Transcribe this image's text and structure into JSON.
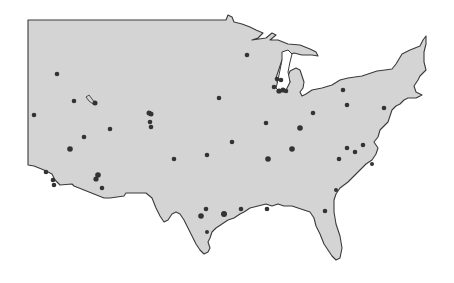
{
  "map": {
    "title": "",
    "region": "Contiguous United States (central & eastern)",
    "colors": {
      "land": "#d4d4d4",
      "water": "#ffffff",
      "coastline": "#3a3a3a",
      "marker": "#333333"
    },
    "land_outline": "M28,20 L226,20 L228,15 L232,17 L234,22 L242,24 L250,27 L256,30 L263,33 L258,38 L252,40 L266,38 L272,33 L276,35 L270,40 L278,40 L288,44 L300,45 L310,49 L316,52 L318,56 L312,55 L302,55 L294,53 L288,55 L285,58 L282,60 L280,66 L278,72 L276,78 L278,84 L281,88 L287,88 L290,82 L288,76 L290,71 L296,68 L300,70 L302,76 L304,82 L303,88 L300,92 L302,96 L306,94 L312,90 L322,88 L332,85 L340,80 L348,78 L362,76 L377,71 L385,70 L392,69 L396,64 L399,59 L402,54 L410,50 L420,46 L423,40 L426,36 L426,44 L424,52 L424,62 L426,70 L420,76 L418,80 L414,86 L416,92 L422,95 L416,98 L408,98 L404,100 L400,104 L396,106 L392,110 L390,116 L388,122 L384,126 L380,130 L378,137 L374,142 L378,148 L376,154 L372,160 L366,164 L360,170 L354,176 L348,182 L340,188 L336,194 L334,200 L334,212 L336,224 L340,236 L342,248 L340,258 L336,260 L332,256 L328,250 L324,244 L320,234 L316,226 L314,218 L310,212 L304,210 L298,208 L292,206 L284,206 L278,204 L272,206 L266,204 L258,206 L250,208 L244,212 L240,214 L234,218 L228,220 L222,224 L216,228 L212,232 L210,238 L208,242 L210,248 L208,252 L204,254 L200,250 L196,244 L192,236 L188,228 L184,220 L180,214 L176,212 L172,214 L168,220 L164,222 L160,216 L156,208 L152,198 L146,193 L138,193 L126,193 L124,196 L110,198 L104,198 L94,194 L84,190 L74,186 L72,184 L60,185 L55,180 L52,174 L44,170 L34,166 L28,165 Z",
    "great_lakes_outline": "M256,60 L262,54 L268,52 L276,50 L284,52 L290,56 L292,62 L290,70 L288,78 L290,86 L286,90 L282,92 L276,88 L274,80 L272,72 L268,66 L262,64 Z",
    "lake_michigan": "M282,52 L288,50 L292,54 L290,62 L288,72 L290,82 L286,90 L280,92 L276,88 L278,80 L280,70 L282,60 Z",
    "inland_marks": [
      {
        "name": "great-salt-lake",
        "path": "M86,97 L89,95 L92,99 L95,103 L93,104 L89,101 Z"
      }
    ],
    "markers": [
      {
        "x": 57,
        "y": 74,
        "r": 2.3
      },
      {
        "x": 34,
        "y": 115,
        "r": 2.3
      },
      {
        "x": 74,
        "y": 101,
        "r": 2.3
      },
      {
        "x": 95,
        "y": 103,
        "r": 2.5
      },
      {
        "x": 149,
        "y": 113,
        "r": 2.5
      },
      {
        "x": 151,
        "y": 114,
        "r": 2.5
      },
      {
        "x": 150,
        "y": 122,
        "r": 2.3
      },
      {
        "x": 151,
        "y": 127,
        "r": 2.3
      },
      {
        "x": 84,
        "y": 137,
        "r": 2.3
      },
      {
        "x": 110,
        "y": 129,
        "r": 2.3
      },
      {
        "x": 70,
        "y": 149,
        "r": 2.8
      },
      {
        "x": 219,
        "y": 98,
        "r": 2.3
      },
      {
        "x": 247,
        "y": 55,
        "r": 2.3
      },
      {
        "x": 277,
        "y": 79,
        "r": 2.3
      },
      {
        "x": 281,
        "y": 80,
        "r": 2.3
      },
      {
        "x": 274,
        "y": 87,
        "r": 2.3
      },
      {
        "x": 279,
        "y": 91,
        "r": 2.6
      },
      {
        "x": 283,
        "y": 90,
        "r": 2.6
      },
      {
        "x": 286,
        "y": 91,
        "r": 2.3
      },
      {
        "x": 343,
        "y": 90,
        "r": 2.3
      },
      {
        "x": 347,
        "y": 105,
        "r": 2.3
      },
      {
        "x": 313,
        "y": 113,
        "r": 2.3
      },
      {
        "x": 384,
        "y": 108,
        "r": 2.3
      },
      {
        "x": 266,
        "y": 123,
        "r": 2.3
      },
      {
        "x": 300,
        "y": 128,
        "r": 2.8
      },
      {
        "x": 232,
        "y": 142,
        "r": 2.3
      },
      {
        "x": 207,
        "y": 155,
        "r": 2.3
      },
      {
        "x": 174,
        "y": 159,
        "r": 2.3
      },
      {
        "x": 268,
        "y": 159,
        "r": 2.8
      },
      {
        "x": 292,
        "y": 149,
        "r": 2.8
      },
      {
        "x": 347,
        "y": 148,
        "r": 2.3
      },
      {
        "x": 355,
        "y": 152,
        "r": 2.3
      },
      {
        "x": 363,
        "y": 145,
        "r": 2.3
      },
      {
        "x": 339,
        "y": 159,
        "r": 2.3
      },
      {
        "x": 98,
        "y": 175,
        "r": 2.8
      },
      {
        "x": 96,
        "y": 179,
        "r": 2.6
      },
      {
        "x": 102,
        "y": 188,
        "r": 2.3
      },
      {
        "x": 46,
        "y": 172,
        "r": 2.3
      },
      {
        "x": 53,
        "y": 180,
        "r": 2.3
      },
      {
        "x": 54,
        "y": 185,
        "r": 2.3
      },
      {
        "x": 206,
        "y": 209,
        "r": 2.3
      },
      {
        "x": 201,
        "y": 216,
        "r": 2.8
      },
      {
        "x": 224,
        "y": 214,
        "r": 3.0
      },
      {
        "x": 241,
        "y": 209,
        "r": 2.3
      },
      {
        "x": 207,
        "y": 232,
        "r": 2.0
      },
      {
        "x": 267,
        "y": 209,
        "r": 2.3
      },
      {
        "x": 325,
        "y": 211,
        "r": 2.3
      },
      {
        "x": 336,
        "y": 190,
        "r": 2.0
      },
      {
        "x": 372,
        "y": 164,
        "r": 2.0
      }
    ]
  }
}
